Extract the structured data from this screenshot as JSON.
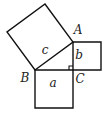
{
  "diagram": {
    "stroke_color": "#111111",
    "background": "#ffffff",
    "vertices": {
      "A": [
        73,
        42
      ],
      "B": [
        35,
        70
      ],
      "C": [
        73,
        70
      ]
    },
    "squares": {
      "a": {
        "points": "35,70 73,70 73,108 35,108",
        "label": "a",
        "label_pos": [
          53,
          87
        ]
      },
      "b": {
        "points": "73,42 101,42 101,70 73,70",
        "label": "b",
        "label_pos": [
          79,
          59
        ]
      },
      "c": {
        "points": "35,70 73,42 45,4 7,32",
        "label": "c",
        "label_pos": [
          45,
          54
        ]
      }
    },
    "vertex_labels": {
      "A": {
        "text": "A",
        "pos": [
          78,
          34
        ]
      },
      "B": {
        "text": "B",
        "pos": [
          25,
          82
        ]
      },
      "C": {
        "text": "C",
        "pos": [
          80,
          83
        ]
      }
    },
    "right_angle_marker": {
      "at": "C",
      "size": 4
    }
  }
}
